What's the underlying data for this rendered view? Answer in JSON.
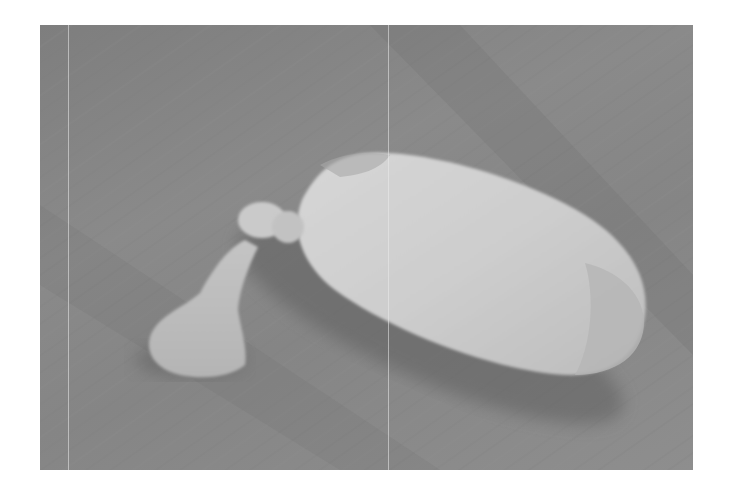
{
  "image": {
    "subject": "tied white fabric pouch with knotted tail lying on wooden floor",
    "palette": {
      "floor": "#848484",
      "floor_dark": "#6f6f6f",
      "pouch": "#cfcfcf",
      "pouch_highlight": "#dadada",
      "tail": "#bdbdbd",
      "shadow": "#5e5e5e",
      "margin": "#ffffff"
    }
  }
}
